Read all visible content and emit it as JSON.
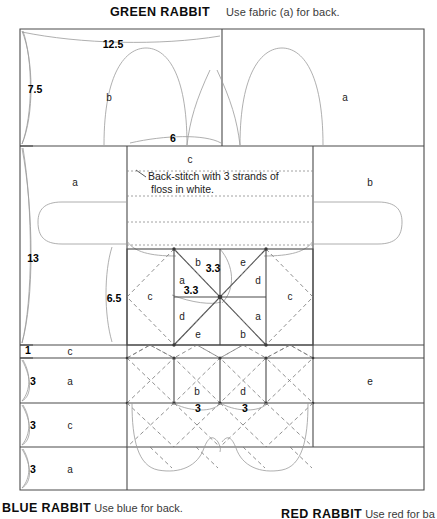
{
  "header": {
    "title": "GREEN RABBIT",
    "note": "Use fabric (a) for back."
  },
  "footer": [
    {
      "name": "BLUE RABBIT",
      "note": "Use blue for back."
    },
    {
      "name": "RED RABBIT",
      "note": "Use red for ba"
    }
  ],
  "annotation": {
    "line1": "Back-stitch with 3 strands of",
    "line2": "floss in white."
  },
  "dimensions": {
    "top_width": "12.5",
    "left_top": "7.5",
    "neck_width": "6",
    "left_mid": "13",
    "block_height": "6.5",
    "star_diag_1": "3.3",
    "star_diag_2": "3.3",
    "left_row_1": "1",
    "left_row_2": "3",
    "left_row_3": "3",
    "left_row_4": "3",
    "strip_cell_1": "3",
    "strip_cell_2": "3"
  },
  "fabric_labels": {
    "top_left_body": "b",
    "top_right_body": "a",
    "neck_center": "c",
    "mid_left_body": "a",
    "mid_right_body": "b",
    "star_left_c": "c",
    "star_right_c": "c",
    "star_b_top": "b",
    "star_e_top": "e",
    "star_a_upper": "a",
    "star_d_upper": "d",
    "star_d_lower": "d",
    "star_a_lower": "a",
    "star_e_bottom": "e",
    "star_b_bottom": "b",
    "row1_label": "c",
    "row2_label": "a",
    "row2_right_label": "e",
    "row3_label": "c",
    "row4_label": "a",
    "strip_b": "b",
    "strip_d": "d"
  },
  "colors": {
    "solid_line": "#4a4a4a",
    "thin_line": "#8a8a8a",
    "dashed_line": "#7a7a7a",
    "text": "#111111",
    "background": "#ffffff"
  }
}
